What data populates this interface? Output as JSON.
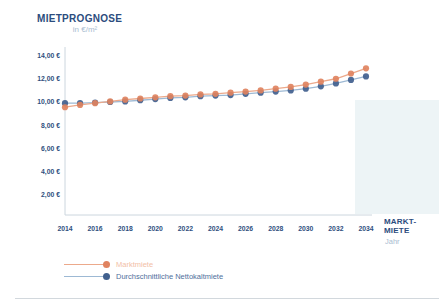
{
  "page": {
    "title": "MIETPROGNOSE",
    "subtitle": "in €/m²"
  },
  "chart_data": {
    "type": "line",
    "title": "MIETPROGNOSE",
    "unit_label": "in €/m²",
    "x_axis_label_line1": "MARKT-",
    "x_axis_label_line2": "MIETE",
    "x_axis_sublabel": "Jahr",
    "x": [
      2014,
      2015,
      2016,
      2017,
      2018,
      2019,
      2020,
      2021,
      2022,
      2023,
      2024,
      2025,
      2026,
      2027,
      2028,
      2029,
      2030,
      2031,
      2032,
      2033,
      2034
    ],
    "x_tick_labels": [
      "2014",
      "2016",
      "2018",
      "2020",
      "2022",
      "2024",
      "2026",
      "2028",
      "2030",
      "2032",
      "2034"
    ],
    "y_ticks": [
      2,
      4,
      6,
      8,
      10,
      12,
      14
    ],
    "y_tick_labels": [
      "2,00 €",
      "4,00 €",
      "6,00 €",
      "8,00 €",
      "10,00 €",
      "12,00 €",
      "14,00 €"
    ],
    "ylim": [
      0,
      14
    ],
    "grid": false,
    "legend_position": "bottom-left",
    "series": [
      {
        "name": "Marktmiete",
        "dot_color": "#e08360",
        "line_color": "#eca98b",
        "text_color": "#f2c0a6",
        "values": [
          9.55,
          9.75,
          9.9,
          10.05,
          10.2,
          10.3,
          10.4,
          10.5,
          10.55,
          10.65,
          10.7,
          10.8,
          10.9,
          11.0,
          11.15,
          11.3,
          11.5,
          11.75,
          12.0,
          12.45,
          12.9
        ]
      },
      {
        "name": "Durchschnittliche Nettokaltmiete",
        "dot_color": "#41608e",
        "line_color": "#9db9d4",
        "text_color": "#4f6f9c",
        "values": [
          9.9,
          9.9,
          9.95,
          10.0,
          10.05,
          10.15,
          10.25,
          10.35,
          10.4,
          10.5,
          10.55,
          10.6,
          10.7,
          10.8,
          10.9,
          11.0,
          11.15,
          11.35,
          11.6,
          11.9,
          12.2
        ]
      }
    ],
    "axis_color": "#ccd6de",
    "tick_label_color": "#2f4f7e"
  }
}
